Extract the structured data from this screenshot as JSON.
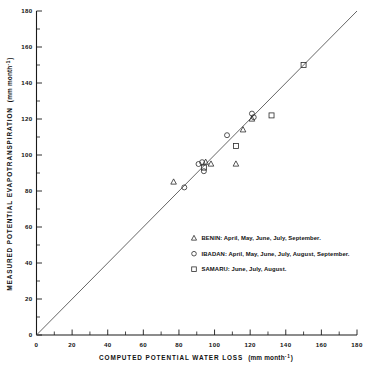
{
  "chart_data": {
    "type": "scatter",
    "title": "",
    "xlabel": "COMPUTED POTENTIAL WATER LOSS",
    "xlabel_unit": "(mm month",
    "xlabel_unit_exp": "-1",
    "xlabel_unit_close": ")",
    "ylabel": "MEASURED POTENTIAL EVAPOTRANSPIRATION",
    "ylabel_unit": "(mm month",
    "ylabel_unit_exp": "-1",
    "ylabel_unit_close": ")",
    "xlim": [
      0,
      180
    ],
    "ylim": [
      0,
      180
    ],
    "xticks": [
      0,
      20,
      40,
      60,
      80,
      100,
      120,
      140,
      160,
      180
    ],
    "yticks": [
      0,
      20,
      40,
      60,
      80,
      100,
      120,
      140,
      160,
      180
    ],
    "xtick_labels": [
      "0",
      "20",
      "40",
      "60",
      "80",
      "100",
      "120",
      "140",
      "160",
      "180"
    ],
    "ytick_labels": [
      "0",
      "20",
      "40",
      "60",
      "80",
      "100",
      "120",
      "140",
      "160",
      "180"
    ],
    "grid": false,
    "minor_ticks": true,
    "minor_tick_step": 10,
    "legend_position": "inside-lower-right",
    "reference_line": {
      "label": "1:1 line",
      "x": [
        0,
        180
      ],
      "y": [
        0,
        180
      ]
    },
    "series": [
      {
        "name": "BENIN",
        "marker": "triangle",
        "months": [
          "April",
          "May",
          "June",
          "July",
          "September"
        ],
        "points": [
          {
            "x": 77,
            "y": 85
          },
          {
            "x": 95,
            "y": 96
          },
          {
            "x": 98,
            "y": 95
          },
          {
            "x": 112,
            "y": 95
          },
          {
            "x": 116,
            "y": 114
          },
          {
            "x": 121,
            "y": 120
          }
        ]
      },
      {
        "name": "IBADAN",
        "marker": "circle",
        "months": [
          "April",
          "May",
          "June",
          "July",
          "August",
          "September"
        ],
        "points": [
          {
            "x": 83,
            "y": 82
          },
          {
            "x": 91,
            "y": 95
          },
          {
            "x": 94,
            "y": 91
          },
          {
            "x": 93,
            "y": 96
          },
          {
            "x": 107,
            "y": 111
          },
          {
            "x": 122,
            "y": 121
          },
          {
            "x": 121,
            "y": 123
          }
        ]
      },
      {
        "name": "SAMARU",
        "marker": "square",
        "months": [
          "June",
          "July",
          "August"
        ],
        "points": [
          {
            "x": 94,
            "y": 93
          },
          {
            "x": 112,
            "y": 105
          },
          {
            "x": 132,
            "y": 122
          },
          {
            "x": 150,
            "y": 150
          }
        ]
      }
    ]
  },
  "legend": {
    "entries": [
      {
        "marker": "triangle",
        "text": "BENIN: April, May, June, July, September."
      },
      {
        "marker": "circle",
        "text": "IBADAN: April, May, June, July, August, September."
      },
      {
        "marker": "square",
        "text": "SAMARU: June, July, August."
      }
    ]
  }
}
